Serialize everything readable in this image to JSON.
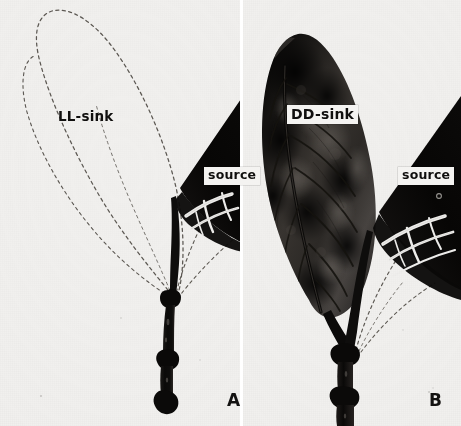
{
  "figure": {
    "background_color": "#f1f0ee",
    "ink_color": "#100f0e",
    "width": 461,
    "height": 426
  },
  "panels": [
    {
      "id": "A",
      "letter": "A",
      "letter_name": "panel-letter-a",
      "sink_label": "LL-sink",
      "sink_label_style": "plain",
      "sink_visible_in_autoradiograph": false,
      "sink_outline": "dashed",
      "source_label": "source",
      "source_label_style": "boxed",
      "description": "Sink leaf shows no radioactive label; its position is marked only by a hand-drawn dashed outline. The source leaf and the stem are densely labelled (black)."
    },
    {
      "id": "B",
      "letter": "B",
      "letter_name": "panel-letter-b",
      "sink_label": "DD-sink",
      "sink_label_style": "boxed",
      "sink_visible_in_autoradiograph": true,
      "sink_outline": "none",
      "source_label": "source",
      "source_label_style": "boxed",
      "description": "Sink leaf is strongly labelled, appearing as a dark autoradiograph image with visible midrib and lateral veins. The source leaf and stem are also densely labelled."
    }
  ],
  "icons": {
    "leaf_outline_icon": "leaf-outline-icon",
    "leaf_autoradiograph_icon": "leaf-autoradiograph-icon",
    "stem_icon": "stem-icon",
    "source_leaf_icon": "source-leaf-icon"
  },
  "colors": {
    "paper": "#f1f0ee",
    "label_box": "#f4f3f1",
    "dark_tissue": "#0d0c0b",
    "mid_tissue": "#3a3632",
    "dash_outline": "#58544e",
    "vein": "#1a1817",
    "text": "#100f0e"
  }
}
